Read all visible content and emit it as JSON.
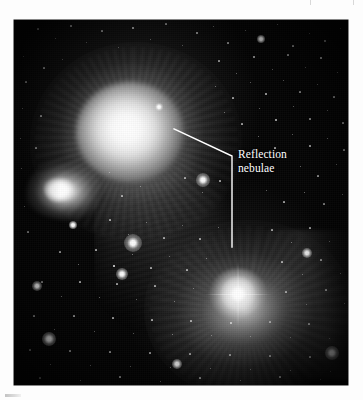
{
  "figure": {
    "kind": "astronomical-photograph",
    "subject": "Reflection nebulae",
    "plate_background_color": "#040404",
    "page_background_color": "#fdfdfd",
    "annotation_color": "#ffffff"
  },
  "annotations": [
    {
      "id": "reflection-nebulae",
      "line1": "Reflection",
      "line2": "nebulae",
      "text_x": 224,
      "text_y": 128,
      "leader": {
        "points": "160,109 218,136 218,227",
        "target_upper": "upper reflection nebula",
        "target_lower": "lower reflection nebula",
        "stroke_width": 1.4
      }
    }
  ],
  "scan_marks": {
    "ticks": [
      {
        "x": 310
      },
      {
        "x": 353
      }
    ],
    "smudge_label": "caption-edge-artifact"
  },
  "stars": [
    {
      "x": 24,
      "y": 9,
      "r": 0.6,
      "o": 0.62
    },
    {
      "x": 41,
      "y": 18,
      "r": 0.5,
      "o": 0.5
    },
    {
      "x": 57,
      "y": 6,
      "r": 0.7,
      "o": 0.7
    },
    {
      "x": 72,
      "y": 22,
      "r": 0.5,
      "o": 0.45
    },
    {
      "x": 88,
      "y": 11,
      "r": 0.6,
      "o": 0.6
    },
    {
      "x": 104,
      "y": 27,
      "r": 0.5,
      "o": 0.48
    },
    {
      "x": 119,
      "y": 8,
      "r": 0.8,
      "o": 0.8
    },
    {
      "x": 136,
      "y": 19,
      "r": 0.5,
      "o": 0.5
    },
    {
      "x": 152,
      "y": 4,
      "r": 0.6,
      "o": 0.55
    },
    {
      "x": 168,
      "y": 25,
      "r": 0.5,
      "o": 0.45
    },
    {
      "x": 183,
      "y": 13,
      "r": 0.7,
      "o": 0.68
    },
    {
      "x": 199,
      "y": 6,
      "r": 0.5,
      "o": 0.5
    },
    {
      "x": 214,
      "y": 23,
      "r": 0.6,
      "o": 0.58
    },
    {
      "x": 231,
      "y": 10,
      "r": 0.5,
      "o": 0.45
    },
    {
      "x": 247,
      "y": 19,
      "r": 0.9,
      "o": 0.9
    },
    {
      "x": 263,
      "y": 4,
      "r": 0.5,
      "o": 0.5
    },
    {
      "x": 279,
      "y": 26,
      "r": 0.6,
      "o": 0.6
    },
    {
      "x": 295,
      "y": 13,
      "r": 0.5,
      "o": 0.45
    },
    {
      "x": 311,
      "y": 21,
      "r": 0.7,
      "o": 0.7
    },
    {
      "x": 326,
      "y": 8,
      "r": 0.5,
      "o": 0.5
    },
    {
      "x": 9,
      "y": 36,
      "r": 0.5,
      "o": 0.45
    },
    {
      "x": 30,
      "y": 48,
      "r": 0.6,
      "o": 0.6
    },
    {
      "x": 48,
      "y": 39,
      "r": 0.5,
      "o": 0.45
    },
    {
      "x": 205,
      "y": 41,
      "r": 0.6,
      "o": 0.6
    },
    {
      "x": 222,
      "y": 53,
      "r": 0.5,
      "o": 0.5
    },
    {
      "x": 240,
      "y": 37,
      "r": 0.7,
      "o": 0.7
    },
    {
      "x": 258,
      "y": 49,
      "r": 0.5,
      "o": 0.48
    },
    {
      "x": 274,
      "y": 35,
      "r": 0.6,
      "o": 0.6
    },
    {
      "x": 291,
      "y": 47,
      "r": 0.5,
      "o": 0.45
    },
    {
      "x": 307,
      "y": 38,
      "r": 0.8,
      "o": 0.8
    },
    {
      "x": 323,
      "y": 52,
      "r": 0.5,
      "o": 0.5
    },
    {
      "x": 12,
      "y": 62,
      "r": 0.6,
      "o": 0.55
    },
    {
      "x": 201,
      "y": 66,
      "r": 0.5,
      "o": 0.5
    },
    {
      "x": 219,
      "y": 78,
      "r": 0.6,
      "o": 0.6
    },
    {
      "x": 236,
      "y": 62,
      "r": 0.5,
      "o": 0.45
    },
    {
      "x": 252,
      "y": 74,
      "r": 0.7,
      "o": 0.7
    },
    {
      "x": 269,
      "y": 60,
      "r": 0.5,
      "o": 0.5
    },
    {
      "x": 286,
      "y": 72,
      "r": 0.6,
      "o": 0.58
    },
    {
      "x": 303,
      "y": 64,
      "r": 0.5,
      "o": 0.45
    },
    {
      "x": 320,
      "y": 77,
      "r": 0.6,
      "o": 0.6
    },
    {
      "x": 8,
      "y": 88,
      "r": 0.5,
      "o": 0.45
    },
    {
      "x": 27,
      "y": 96,
      "r": 0.6,
      "o": 0.55
    },
    {
      "x": 210,
      "y": 92,
      "r": 0.5,
      "o": 0.5
    },
    {
      "x": 228,
      "y": 104,
      "r": 0.6,
      "o": 0.6
    },
    {
      "x": 245,
      "y": 88,
      "r": 0.5,
      "o": 0.45
    },
    {
      "x": 262,
      "y": 100,
      "r": 0.7,
      "o": 0.68
    },
    {
      "x": 279,
      "y": 86,
      "r": 0.5,
      "o": 0.5
    },
    {
      "x": 296,
      "y": 99,
      "r": 0.6,
      "o": 0.58
    },
    {
      "x": 313,
      "y": 90,
      "r": 0.5,
      "o": 0.45
    },
    {
      "x": 329,
      "y": 103,
      "r": 0.6,
      "o": 0.6
    },
    {
      "x": 6,
      "y": 118,
      "r": 0.5,
      "o": 0.45
    },
    {
      "x": 22,
      "y": 128,
      "r": 0.6,
      "o": 0.5
    },
    {
      "x": 244,
      "y": 116,
      "r": 0.5,
      "o": 0.5
    },
    {
      "x": 261,
      "y": 128,
      "r": 0.6,
      "o": 0.6
    },
    {
      "x": 278,
      "y": 114,
      "r": 0.5,
      "o": 0.45
    },
    {
      "x": 296,
      "y": 126,
      "r": 0.7,
      "o": 0.7
    },
    {
      "x": 313,
      "y": 118,
      "r": 0.5,
      "o": 0.5
    },
    {
      "x": 330,
      "y": 130,
      "r": 0.6,
      "o": 0.55
    },
    {
      "x": 7,
      "y": 148,
      "r": 0.5,
      "o": 0.45
    },
    {
      "x": 95,
      "y": 152,
      "r": 0.5,
      "o": 0.5
    },
    {
      "x": 286,
      "y": 146,
      "r": 0.5,
      "o": 0.48
    },
    {
      "x": 304,
      "y": 156,
      "r": 0.6,
      "o": 0.6
    },
    {
      "x": 322,
      "y": 144,
      "r": 0.5,
      "o": 0.45
    },
    {
      "x": 108,
      "y": 176,
      "r": 0.6,
      "o": 0.6
    },
    {
      "x": 126,
      "y": 166,
      "r": 0.5,
      "o": 0.5
    },
    {
      "x": 171,
      "y": 158,
      "r": 0.6,
      "o": 0.6
    },
    {
      "x": 188,
      "y": 172,
      "r": 0.5,
      "o": 0.5
    },
    {
      "x": 206,
      "y": 161,
      "r": 0.6,
      "o": 0.6
    },
    {
      "x": 252,
      "y": 170,
      "r": 0.5,
      "o": 0.45
    },
    {
      "x": 270,
      "y": 182,
      "r": 0.6,
      "o": 0.6
    },
    {
      "x": 290,
      "y": 172,
      "r": 0.5,
      "o": 0.5
    },
    {
      "x": 310,
      "y": 184,
      "r": 0.6,
      "o": 0.55
    },
    {
      "x": 328,
      "y": 174,
      "r": 0.5,
      "o": 0.45
    },
    {
      "x": 10,
      "y": 186,
      "r": 0.5,
      "o": 0.45
    },
    {
      "x": 14,
      "y": 212,
      "r": 0.6,
      "o": 0.5
    },
    {
      "x": 96,
      "y": 200,
      "r": 0.6,
      "o": 0.6
    },
    {
      "x": 114,
      "y": 214,
      "r": 0.5,
      "o": 0.5
    },
    {
      "x": 132,
      "y": 202,
      "r": 0.5,
      "o": 0.5
    },
    {
      "x": 150,
      "y": 218,
      "r": 0.6,
      "o": 0.6
    },
    {
      "x": 168,
      "y": 205,
      "r": 0.5,
      "o": 0.45
    },
    {
      "x": 186,
      "y": 219,
      "r": 0.6,
      "o": 0.6
    },
    {
      "x": 204,
      "y": 207,
      "r": 0.5,
      "o": 0.5
    },
    {
      "x": 258,
      "y": 210,
      "r": 0.6,
      "o": 0.58
    },
    {
      "x": 277,
      "y": 222,
      "r": 0.5,
      "o": 0.5
    },
    {
      "x": 296,
      "y": 208,
      "r": 0.6,
      "o": 0.6
    },
    {
      "x": 315,
      "y": 221,
      "r": 0.5,
      "o": 0.45
    },
    {
      "x": 46,
      "y": 232,
      "r": 0.6,
      "o": 0.55
    },
    {
      "x": 64,
      "y": 244,
      "r": 0.5,
      "o": 0.5
    },
    {
      "x": 82,
      "y": 230,
      "r": 0.6,
      "o": 0.6
    },
    {
      "x": 100,
      "y": 246,
      "r": 0.8,
      "o": 0.85
    },
    {
      "x": 118,
      "y": 234,
      "r": 0.5,
      "o": 0.5
    },
    {
      "x": 137,
      "y": 248,
      "r": 0.6,
      "o": 0.6
    },
    {
      "x": 155,
      "y": 236,
      "r": 0.5,
      "o": 0.45
    },
    {
      "x": 173,
      "y": 250,
      "r": 0.6,
      "o": 0.6
    },
    {
      "x": 192,
      "y": 238,
      "r": 0.5,
      "o": 0.5
    },
    {
      "x": 268,
      "y": 242,
      "r": 0.6,
      "o": 0.6
    },
    {
      "x": 288,
      "y": 254,
      "r": 0.5,
      "o": 0.5
    },
    {
      "x": 307,
      "y": 240,
      "r": 0.6,
      "o": 0.58
    },
    {
      "x": 326,
      "y": 253,
      "r": 0.5,
      "o": 0.45
    },
    {
      "x": 28,
      "y": 262,
      "r": 0.6,
      "o": 0.5
    },
    {
      "x": 47,
      "y": 276,
      "r": 0.5,
      "o": 0.5
    },
    {
      "x": 66,
      "y": 262,
      "r": 0.6,
      "o": 0.6
    },
    {
      "x": 85,
      "y": 277,
      "r": 0.5,
      "o": 0.5
    },
    {
      "x": 103,
      "y": 264,
      "r": 0.6,
      "o": 0.6
    },
    {
      "x": 122,
      "y": 279,
      "r": 0.5,
      "o": 0.45
    },
    {
      "x": 141,
      "y": 266,
      "r": 0.6,
      "o": 0.6
    },
    {
      "x": 160,
      "y": 281,
      "r": 0.5,
      "o": 0.5
    },
    {
      "x": 179,
      "y": 268,
      "r": 0.5,
      "o": 0.5
    },
    {
      "x": 272,
      "y": 272,
      "r": 0.6,
      "o": 0.6
    },
    {
      "x": 292,
      "y": 284,
      "r": 0.5,
      "o": 0.5
    },
    {
      "x": 312,
      "y": 270,
      "r": 0.6,
      "o": 0.58
    },
    {
      "x": 330,
      "y": 283,
      "r": 0.5,
      "o": 0.45
    },
    {
      "x": 20,
      "y": 296,
      "r": 0.6,
      "o": 0.55
    },
    {
      "x": 40,
      "y": 309,
      "r": 0.5,
      "o": 0.5
    },
    {
      "x": 60,
      "y": 296,
      "r": 0.6,
      "o": 0.6
    },
    {
      "x": 80,
      "y": 311,
      "r": 0.5,
      "o": 0.5
    },
    {
      "x": 99,
      "y": 298,
      "r": 0.6,
      "o": 0.6
    },
    {
      "x": 119,
      "y": 313,
      "r": 0.5,
      "o": 0.45
    },
    {
      "x": 138,
      "y": 300,
      "r": 0.6,
      "o": 0.6
    },
    {
      "x": 158,
      "y": 314,
      "r": 0.5,
      "o": 0.5
    },
    {
      "x": 177,
      "y": 301,
      "r": 0.6,
      "o": 0.6
    },
    {
      "x": 197,
      "y": 315,
      "r": 0.5,
      "o": 0.5
    },
    {
      "x": 217,
      "y": 303,
      "r": 0.6,
      "o": 0.6
    },
    {
      "x": 236,
      "y": 316,
      "r": 0.5,
      "o": 0.5
    },
    {
      "x": 256,
      "y": 302,
      "r": 0.6,
      "o": 0.58
    },
    {
      "x": 276,
      "y": 317,
      "r": 0.5,
      "o": 0.5
    },
    {
      "x": 295,
      "y": 304,
      "r": 0.6,
      "o": 0.6
    },
    {
      "x": 315,
      "y": 318,
      "r": 0.5,
      "o": 0.45
    },
    {
      "x": 16,
      "y": 330,
      "r": 0.6,
      "o": 0.5
    },
    {
      "x": 36,
      "y": 344,
      "r": 0.5,
      "o": 0.5
    },
    {
      "x": 56,
      "y": 331,
      "r": 0.6,
      "o": 0.6
    },
    {
      "x": 76,
      "y": 345,
      "r": 0.5,
      "o": 0.5
    },
    {
      "x": 96,
      "y": 332,
      "r": 0.6,
      "o": 0.6
    },
    {
      "x": 116,
      "y": 346,
      "r": 0.5,
      "o": 0.45
    },
    {
      "x": 136,
      "y": 333,
      "r": 0.6,
      "o": 0.6
    },
    {
      "x": 156,
      "y": 347,
      "r": 0.5,
      "o": 0.5
    },
    {
      "x": 176,
      "y": 334,
      "r": 0.6,
      "o": 0.6
    },
    {
      "x": 196,
      "y": 348,
      "r": 0.5,
      "o": 0.5
    },
    {
      "x": 216,
      "y": 335,
      "r": 0.6,
      "o": 0.6
    },
    {
      "x": 236,
      "y": 349,
      "r": 0.5,
      "o": 0.5
    },
    {
      "x": 256,
      "y": 336,
      "r": 0.6,
      "o": 0.58
    },
    {
      "x": 276,
      "y": 350,
      "r": 0.5,
      "o": 0.5
    },
    {
      "x": 296,
      "y": 337,
      "r": 0.6,
      "o": 0.6
    },
    {
      "x": 316,
      "y": 351,
      "r": 0.5,
      "o": 0.45
    },
    {
      "x": 26,
      "y": 358,
      "r": 0.6,
      "o": 0.55
    },
    {
      "x": 66,
      "y": 360,
      "r": 0.5,
      "o": 0.5
    },
    {
      "x": 106,
      "y": 357,
      "r": 0.6,
      "o": 0.6
    },
    {
      "x": 146,
      "y": 361,
      "r": 0.5,
      "o": 0.5
    },
    {
      "x": 186,
      "y": 358,
      "r": 0.6,
      "o": 0.6
    },
    {
      "x": 226,
      "y": 360,
      "r": 0.5,
      "o": 0.5
    },
    {
      "x": 266,
      "y": 357,
      "r": 0.6,
      "o": 0.6
    },
    {
      "x": 306,
      "y": 359,
      "r": 0.5,
      "o": 0.5
    }
  ],
  "bright_stars": [
    {
      "name": "lower-bright-star",
      "x": 224,
      "y": 274,
      "r": 3.4,
      "glow": 17,
      "spikes": true
    },
    {
      "name": "mid-field-bright-star",
      "x": 119,
      "y": 223,
      "r": 2.2,
      "glow": 9,
      "spikes": false
    },
    {
      "name": "cluster-bright-star",
      "x": 108,
      "y": 254,
      "r": 1.7,
      "glow": 6,
      "spikes": false
    },
    {
      "name": "upper-right-bright-star",
      "x": 189,
      "y": 160,
      "r": 1.8,
      "glow": 7,
      "spikes": false
    },
    {
      "name": "lower-left-bright-star",
      "x": 35,
      "y": 319,
      "r": 1.9,
      "glow": 7,
      "spikes": false
    },
    {
      "name": "bottom-field-bright-star",
      "x": 318,
      "y": 333,
      "r": 1.8,
      "glow": 7,
      "spikes": false
    },
    {
      "name": "bottom-center-bright-star",
      "x": 163,
      "y": 344,
      "r": 1.5,
      "glow": 5,
      "spikes": false
    },
    {
      "name": "left-edge-bright-star",
      "x": 23,
      "y": 266,
      "r": 1.4,
      "glow": 5,
      "spikes": false
    },
    {
      "name": "right-field-bright-star",
      "x": 293,
      "y": 233,
      "r": 1.5,
      "glow": 5,
      "spikes": false
    },
    {
      "name": "knot-adjacent-star",
      "x": 59,
      "y": 205,
      "r": 1.3,
      "glow": 4,
      "spikes": false
    },
    {
      "name": "upper-halo-star",
      "x": 145,
      "y": 87,
      "r": 1.2,
      "glow": 4,
      "spikes": false
    },
    {
      "name": "top-right-star",
      "x": 247,
      "y": 19,
      "r": 1.3,
      "glow": 4,
      "spikes": false
    }
  ]
}
